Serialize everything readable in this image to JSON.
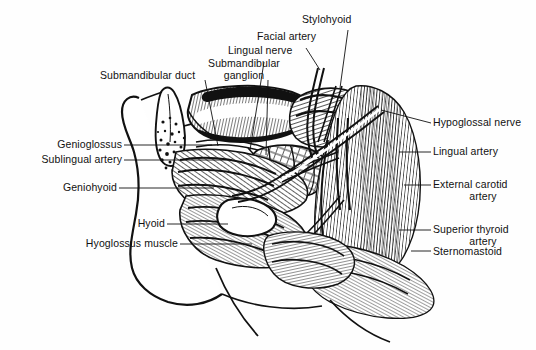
{
  "figure": {
    "style": "black-and-white line engraving / hatched anatomical illustration",
    "background_color": "#fefefe",
    "ink_color": "#111111",
    "width": 536,
    "height": 350
  },
  "labels": {
    "submandibular_duct": "Submandibular duct",
    "submandibular_ganglion": "Submandibular\nganglion",
    "submandibular_ganglion_line1": "Submandibular",
    "submandibular_ganglion_line2": "ganglion",
    "lingual_nerve": "Lingual nerve",
    "facial_artery": "Facial artery",
    "stylohyoid": "Stylohyoid",
    "hypoglossal_nerve": "Hypoglossal nerve",
    "lingual_artery": "Lingual artery",
    "external_carotid_artery_line1": "External carotid",
    "external_carotid_artery_line2": "artery",
    "superior_thyroid_artery_line1": "Superior thyroid",
    "superior_thyroid_artery_line2": "artery",
    "sternomastoid": "Sternomastoid",
    "genioglossus": "Genioglossus",
    "sublingual_artery": "Sublingual artery",
    "geniohyoid": "Geniohyoid",
    "hyoid": "Hyoid",
    "hyoglossus_muscle": "Hyoglossus muscle"
  }
}
